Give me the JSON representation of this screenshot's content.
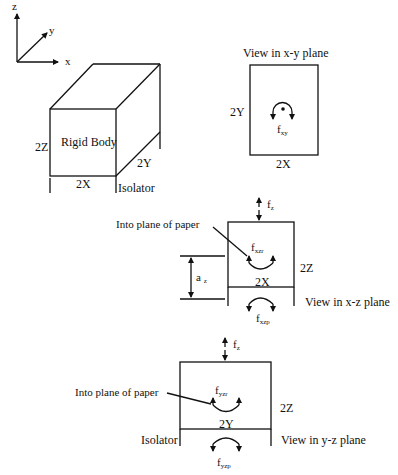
{
  "axes": {
    "z": "z",
    "y": "y",
    "x": "x"
  },
  "rigid_body": {
    "label": "Rigid Body",
    "height_label": "2Z",
    "depth_label": "2Y",
    "width_label": "2X",
    "isolator_label": "Isolator"
  },
  "xy_view": {
    "title": "View in x-y plane",
    "height_label": "2Y",
    "width_label": "2X",
    "moment_label": "f",
    "moment_sub": "xy"
  },
  "xz_view": {
    "title": "View in x-z plane",
    "force_label": "f",
    "force_sub": "z",
    "pointer_label": "Into plane of paper",
    "moment_rotation_label": "f",
    "moment_rotation_sub": "xzr",
    "height_label": "2Z",
    "width_label": "2X",
    "offset_label": "a",
    "offset_sub": "z",
    "moment_plane_label": "f",
    "moment_plane_sub": "xzp"
  },
  "yz_view": {
    "title": "View in y-z plane",
    "force_label": "f",
    "force_sub": "z",
    "pointer_label": "Into plane of paper",
    "moment_rotation_label": "f",
    "moment_rotation_sub": "yzr",
    "height_label": "2Z",
    "width_label": "2Y",
    "isolator_label": "Isolator",
    "moment_plane_label": "f",
    "moment_plane_sub": "yzp"
  }
}
